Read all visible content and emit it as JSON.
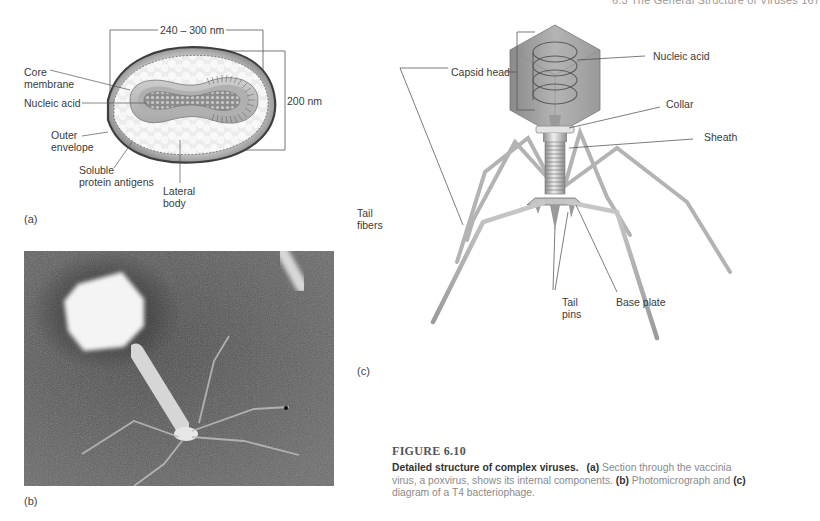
{
  "running_head": "6.3  The General Structure of Viruses    167",
  "panel_a": {
    "letter": "(a)",
    "dimension_width": "240 – 300 nm",
    "dimension_height": "200 nm",
    "labels": {
      "core_membrane_1": "Core",
      "core_membrane_2": "membrane",
      "nucleic_acid": "Nucleic acid",
      "outer_envelope_1": "Outer",
      "outer_envelope_2": "envelope",
      "soluble_1": "Soluble",
      "soluble_2": "protein antigens",
      "lateral_1": "Lateral",
      "lateral_2": "body"
    }
  },
  "panel_b": {
    "letter": "(b)"
  },
  "panel_c": {
    "letter": "(c)",
    "labels": {
      "capsid_head": "Capsid head",
      "nucleic_acid": "Nucleic acid",
      "collar": "Collar",
      "sheath": "Sheath",
      "tail_fibers_1": "Tail",
      "tail_fibers_2": "fibers",
      "tail_pins_1": "Tail",
      "tail_pins_2": "pins",
      "base_plate": "Base plate"
    }
  },
  "caption": {
    "figure_number": "FIGURE 6.10",
    "lead": "Detailed structure of complex viruses.",
    "a_marker": "(a)",
    "a_text": " Section through the vaccinia virus, a poxvirus, shows its internal components. ",
    "b_marker": "(b)",
    "b_text": " Photomicrograph and ",
    "c_marker": "(c)",
    "c_text": " diagram of a T4 bacteriophage."
  }
}
